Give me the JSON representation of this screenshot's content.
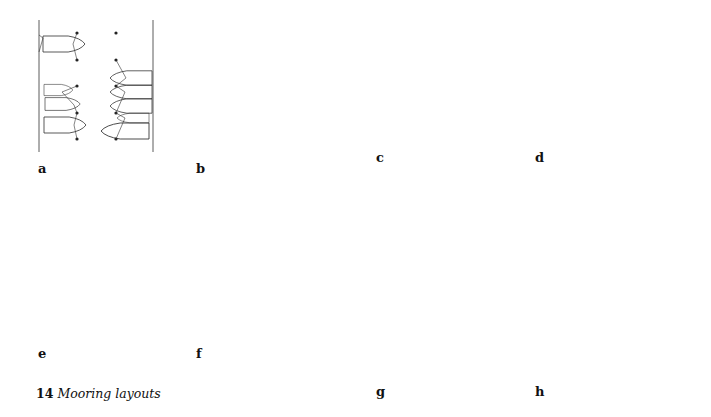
{
  "figure": {
    "number": "14",
    "title": "Mooring layouts"
  },
  "panels": [
    {
      "id": "a",
      "label": "a",
      "description": "Fore-and-aft moorings between piles/buoys and shore"
    },
    {
      "id": "b",
      "label": "b",
      "description": "Bow to buoy, stern to shore"
    },
    {
      "id": "c",
      "label": "c",
      "description": "Pontoon finger berths, boats between fingers"
    },
    {
      "id": "d",
      "label": "d",
      "description": "Pontoon finger berths, multiple boats per bay"
    },
    {
      "id": "e",
      "label": "e",
      "description": "Alongside staging, boats moored along a wall"
    },
    {
      "id": "f",
      "label": "f",
      "description": "Boats moored fan-wise to pontoon with spring lines"
    },
    {
      "id": "g",
      "label": "g",
      "description": "Star mooring around central buoys"
    },
    {
      "id": "h",
      "label": "h",
      "description": "Circular marina with radial finger pontoons"
    }
  ],
  "colors": {
    "line": "#333333",
    "background": "#ffffff"
  }
}
